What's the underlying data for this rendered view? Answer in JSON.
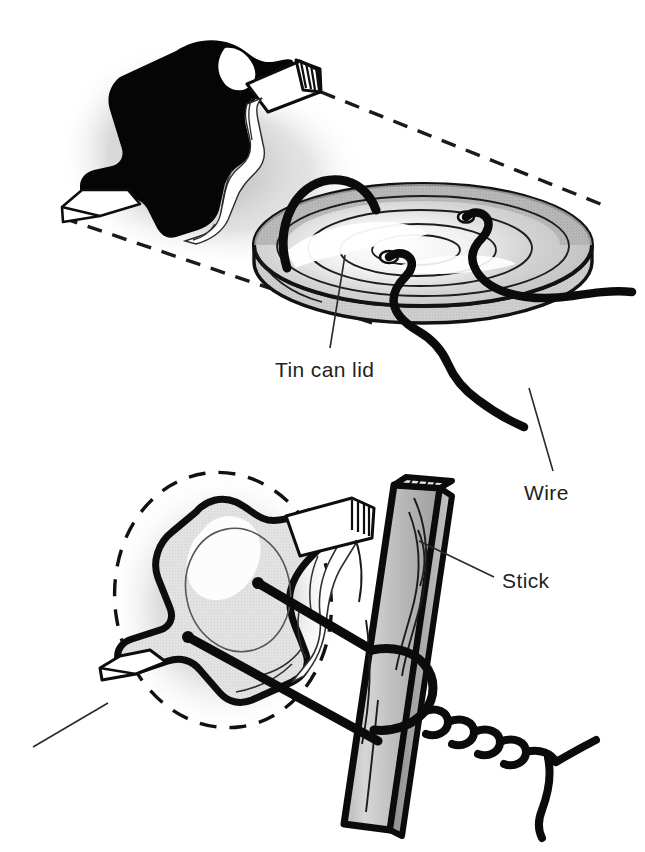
{
  "figure": {
    "background_color": "#ffffff",
    "ink_color": "#1a1a1a",
    "text_color": "#231f20",
    "shade_gray": "#c9c9c9",
    "shade_gray_light": "#dcdcdc",
    "shade_gray_dark": "#a8a8a8",
    "width": 645,
    "height": 852
  },
  "labels": [
    {
      "id": "tin-can-lid",
      "text": "Tin can lid",
      "x": 275,
      "y": 377,
      "leader": {
        "x1": 345,
        "y1": 255,
        "x2": 330,
        "y2": 348
      }
    },
    {
      "id": "wire",
      "text": "Wire",
      "x": 524,
      "y": 500,
      "leader": {
        "x1": 529,
        "y1": 388,
        "x2": 553,
        "y2": 471
      }
    },
    {
      "id": "stick",
      "text": "Stick",
      "x": 502,
      "y": 588,
      "leader": {
        "x1": 419,
        "y1": 541,
        "x2": 494,
        "y2": 577
      }
    },
    {
      "id": "unlabeled-lower-left",
      "text": "",
      "x": 0,
      "y": 0,
      "leader": {
        "x1": 33,
        "y1": 747,
        "x2": 108,
        "y2": 703
      }
    }
  ],
  "panels": [
    {
      "id": "upper-panel",
      "caption": "Tin can lid",
      "parts": [
        "cut-lid-blank",
        "tin-can-lid",
        "wire"
      ]
    },
    {
      "id": "lower-panel",
      "caption": "Stick",
      "parts": [
        "bent-lid-blade",
        "stick",
        "wire",
        "dashed-lid-outline"
      ]
    }
  ],
  "icons": [
    {
      "name": "dashed-projection-line-icon"
    },
    {
      "name": "dashed-ellipse-outline-icon"
    },
    {
      "name": "leader-line-icon"
    },
    {
      "name": "wire-strand-icon"
    },
    {
      "name": "twisted-wire-icon"
    },
    {
      "name": "wood-grain-icon"
    },
    {
      "name": "hatch-marks-icon"
    }
  ]
}
